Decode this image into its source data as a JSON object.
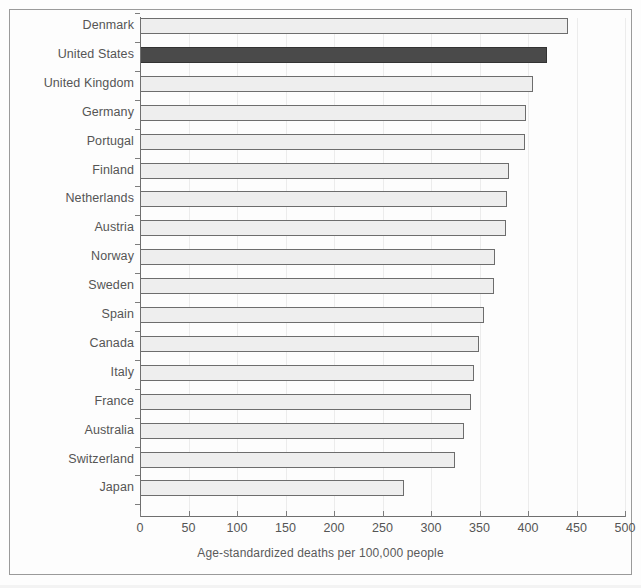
{
  "chart_data": {
    "type": "bar",
    "orientation": "horizontal",
    "title": "",
    "xlabel": "Age-standardized deaths per 100,000 people",
    "ylabel": "",
    "xlim": [
      0,
      500
    ],
    "xticks": [
      0,
      50,
      100,
      150,
      200,
      250,
      300,
      350,
      400,
      450,
      500
    ],
    "xtick_labels": [
      "0",
      "50",
      "100",
      "150",
      "200",
      "250",
      "300",
      "350",
      "400",
      "450",
      "500"
    ],
    "grid": true,
    "legend": null,
    "highlight_category": "United States",
    "highlight_color": "#4a4a4a",
    "bar_color": "#eeeeee",
    "bar_edge_color": "#6d6d6d",
    "categories": [
      "Denmark",
      "United States",
      "United Kingdom",
      "Germany",
      "Portugal",
      "Finland",
      "Netherlands",
      "Austria",
      "Norway",
      "Sweden",
      "Spain",
      "Canada",
      "Italy",
      "France",
      "Australia",
      "Switzerland",
      "Japan"
    ],
    "values": [
      441,
      420,
      405,
      398,
      397,
      380,
      378,
      377,
      366,
      365,
      355,
      349,
      344,
      341,
      334,
      325,
      272
    ],
    "points": [
      {
        "category": "Denmark",
        "value": 441,
        "highlighted": false
      },
      {
        "category": "United States",
        "value": 420,
        "highlighted": true
      },
      {
        "category": "United Kingdom",
        "value": 405,
        "highlighted": false
      },
      {
        "category": "Germany",
        "value": 398,
        "highlighted": false
      },
      {
        "category": "Portugal",
        "value": 397,
        "highlighted": false
      },
      {
        "category": "Finland",
        "value": 380,
        "highlighted": false
      },
      {
        "category": "Netherlands",
        "value": 378,
        "highlighted": false
      },
      {
        "category": "Austria",
        "value": 377,
        "highlighted": false
      },
      {
        "category": "Norway",
        "value": 366,
        "highlighted": false
      },
      {
        "category": "Sweden",
        "value": 365,
        "highlighted": false
      },
      {
        "category": "Spain",
        "value": 355,
        "highlighted": false
      },
      {
        "category": "Canada",
        "value": 349,
        "highlighted": false
      },
      {
        "category": "Italy",
        "value": 344,
        "highlighted": false
      },
      {
        "category": "France",
        "value": 341,
        "highlighted": false
      },
      {
        "category": "Australia",
        "value": 334,
        "highlighted": false
      },
      {
        "category": "Switzerland",
        "value": 325,
        "highlighted": false
      },
      {
        "category": "Japan",
        "value": 272,
        "highlighted": false
      }
    ]
  }
}
